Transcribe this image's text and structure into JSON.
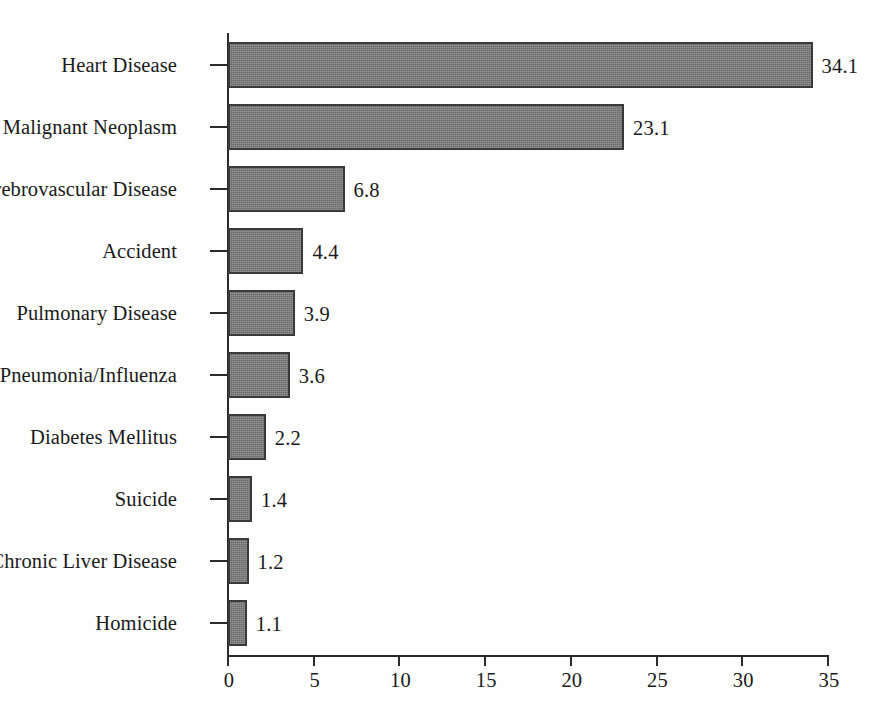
{
  "chart_data": {
    "type": "bar",
    "orientation": "horizontal",
    "title": "",
    "subtitle": "",
    "xlabel": "",
    "ylabel": "",
    "xlim": [
      0,
      35
    ],
    "xticks": [
      0,
      5,
      10,
      15,
      20,
      25,
      30,
      35
    ],
    "xtick_labels": [
      "0",
      "5",
      "10",
      "15",
      "20",
      "25",
      "30",
      "35"
    ],
    "grid": false,
    "legend": null,
    "bar_color": "#7e7e7e",
    "bar_edge_color": "#3a3a3a",
    "axis_color": "#2b2b2b",
    "background_color": "#fefefe",
    "categories": [
      "Heart Disease",
      "Malignant Neoplasm",
      "Cerebrovascular Disease",
      "Accident",
      "Pulmonary Disease",
      "Pneumonia/Influenza",
      "Diabetes Mellitus",
      "Suicide",
      "Chronic Liver Disease",
      "Homicide"
    ],
    "values": [
      34.1,
      23.1,
      6.8,
      4.4,
      3.9,
      3.6,
      2.2,
      1.4,
      1.2,
      1.1
    ],
    "value_labels": [
      "34.1",
      "23.1",
      "6.8",
      "4.4",
      "3.9",
      "3.6",
      "2.2",
      "1.4",
      "1.2",
      "1.1"
    ]
  }
}
